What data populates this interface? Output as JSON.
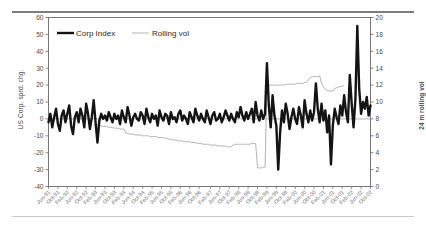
{
  "figure": {
    "background": "#ffffff",
    "rules": {
      "top_color": "#7d7d7d",
      "bottom_color": "#c9c9c9"
    }
  },
  "legend": {
    "position": "top-left-inside",
    "entries": [
      {
        "label": "Corp Index",
        "color": "#141414",
        "width": 2.4,
        "marker": "line-thick"
      },
      {
        "label": "Rolling vol",
        "color": "#b4b4b4",
        "width": 1.0,
        "marker": "line-thin"
      }
    ]
  },
  "axes": {
    "left": {
      "label": "US Corp. sprd. chg.",
      "ticks": [
        60,
        50,
        40,
        30,
        20,
        10,
        0,
        -10,
        -20,
        -30,
        -40
      ],
      "min": -40,
      "max": 60
    },
    "right": {
      "label": "24 m rolling vol",
      "ticks": [
        20,
        18,
        16,
        14,
        12,
        10,
        8,
        6,
        4,
        2,
        0
      ],
      "min": 0,
      "max": 20
    },
    "x": {
      "label": "",
      "tick_rotation": -45,
      "tick_interval_months": 4,
      "ticks": [
        "Jun-91",
        "Oct-91",
        "Feb-92",
        "Jun-92",
        "Oct-92",
        "Feb-93",
        "Jun-93",
        "Oct-93",
        "Feb-94",
        "Jun-94",
        "Oct-94",
        "Feb-95",
        "Jun-95",
        "Oct-95",
        "Feb-96",
        "Jun-96",
        "Oct-96",
        "Feb-97",
        "Jun-97",
        "Oct-97",
        "Feb-98",
        "Jun-98",
        "Oct-98",
        "Feb-99",
        "Jun-99",
        "Oct-99",
        "Feb-00",
        "Jun-00",
        "Oct-00",
        "Feb-01",
        "Jun-01",
        "Oct-01",
        "Feb-02",
        "Jun-02",
        "Oct-02"
      ]
    }
  },
  "chart_data": {
    "type": "line",
    "title": "",
    "subtitle": "",
    "xlabel": "",
    "ylabel": "US Corp. sprd. chg.",
    "y2label": "24 m rolling vol",
    "ylim": [
      -40,
      60
    ],
    "y2lim": [
      0,
      20
    ],
    "grid": false,
    "legend": [
      "Corp Index",
      "Rolling vol"
    ],
    "x_start": "Jun-91",
    "x_end": "Oct-02",
    "x_frequency": "monthly",
    "annotations": [
      "Zero reference line drawn at y = 0 on left axis",
      "Rolling vol series begins around Jun-93",
      "Largest positive spike ~ +55 near Jun-02",
      "Deep negative spikes ~ -30 near Oct-98 and ~ -27 near Feb-01"
    ],
    "series": [
      {
        "name": "Corp Index",
        "axis": "left",
        "color": "#141414",
        "linewidth": 2.4,
        "values": [
          -2,
          3,
          -5,
          1,
          6,
          -3,
          -7,
          2,
          5,
          -2,
          3,
          8,
          -4,
          -9,
          1,
          4,
          -2,
          6,
          2,
          -5,
          9,
          3,
          -6,
          1,
          11,
          -2,
          -14,
          -1,
          3,
          0,
          2,
          -1,
          4,
          1,
          -2,
          3,
          0,
          2,
          -3,
          5,
          1,
          -2,
          7,
          2,
          -4,
          1,
          3,
          0,
          -1,
          4,
          2,
          -3,
          6,
          1,
          -2,
          3,
          0,
          2,
          -4,
          5,
          1,
          -1,
          3,
          2,
          -3,
          4,
          0,
          1,
          -2,
          3,
          5,
          -1,
          2,
          0,
          -3,
          4,
          1,
          -2,
          6,
          2,
          -1,
          3,
          0,
          -2,
          5,
          1,
          -3,
          2,
          4,
          -1,
          0,
          3,
          -2,
          1,
          5,
          2,
          -1,
          3,
          0,
          -2,
          4,
          1,
          7,
          2,
          -1,
          4,
          0,
          3,
          6,
          -2,
          10,
          2,
          -1,
          5,
          0,
          3,
          33,
          8,
          -5,
          14,
          2,
          -4,
          -30,
          -8,
          5,
          -2,
          9,
          3,
          -6,
          1,
          6,
          0,
          -3,
          7,
          2,
          -5,
          11,
          3,
          -2,
          5,
          -1,
          4,
          21,
          6,
          -2,
          9,
          -1,
          5,
          -8,
          2,
          -27,
          -4,
          6,
          1,
          -3,
          8,
          2,
          14,
          4,
          -2,
          26,
          9,
          -5,
          12,
          55,
          18,
          3,
          10,
          6,
          13,
          2,
          8
        ]
      },
      {
        "name": "Rolling vol",
        "axis": "right",
        "color": "#b4b4b4",
        "linewidth": 1.0,
        "start_index": 24,
        "values": [
          7.3,
          7.3,
          7.3,
          7.2,
          7.2,
          7.1,
          7.1,
          7.1,
          7.0,
          7.0,
          7.0,
          6.9,
          6.9,
          6.9,
          6.8,
          6.8,
          6.8,
          6.3,
          6.3,
          6.2,
          6.2,
          6.2,
          6.1,
          6.1,
          6.1,
          6.1,
          6.0,
          6.0,
          6.0,
          6.0,
          5.9,
          5.9,
          5.9,
          5.9,
          5.8,
          5.8,
          5.8,
          5.8,
          5.7,
          5.7,
          5.6,
          5.6,
          5.5,
          5.5,
          5.5,
          5.4,
          5.4,
          5.4,
          5.3,
          5.3,
          5.3,
          5.3,
          5.2,
          5.2,
          5.2,
          5.1,
          5.1,
          5.1,
          5.0,
          5.0,
          5.0,
          5.0,
          4.9,
          4.9,
          4.9,
          4.9,
          4.8,
          4.8,
          4.8,
          4.8,
          4.8,
          4.7,
          4.7,
          4.7,
          4.9,
          5.0,
          5.0,
          5.0,
          5.0,
          5.0,
          5.0,
          5.0,
          5.0,
          5.0,
          5.1,
          5.1,
          5.1,
          2.2,
          2.2,
          2.2,
          2.3,
          2.3,
          11.8,
          11.9,
          12.0,
          12.0,
          12.0,
          12.0,
          12.0,
          12.0,
          12.0,
          12.0,
          12.1,
          12.1,
          12.1,
          12.1,
          12.1,
          12.1,
          12.2,
          12.2,
          12.2,
          12.2,
          12.3,
          12.3,
          12.6,
          12.9,
          13.0,
          13.0,
          13.0,
          13.0,
          13.1,
          12.2,
          11.8,
          11.5,
          11.4,
          11.3,
          11.3,
          11.3,
          11.6,
          11.7,
          11.8,
          11.8,
          11.9,
          11.9
        ]
      }
    ]
  }
}
